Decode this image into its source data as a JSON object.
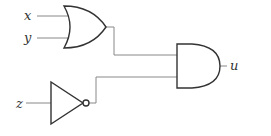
{
  "diagram": {
    "type": "logic-circuit",
    "inputs": [
      {
        "id": "x",
        "label": "x"
      },
      {
        "id": "y",
        "label": "y"
      },
      {
        "id": "z",
        "label": "z"
      }
    ],
    "gates": [
      {
        "id": "or1",
        "kind": "OR",
        "inputs": [
          "x",
          "y"
        ]
      },
      {
        "id": "not1",
        "kind": "NOT",
        "inputs": [
          "z"
        ]
      },
      {
        "id": "and1",
        "kind": "AND",
        "inputs": [
          "or1",
          "not1"
        ]
      }
    ],
    "output": {
      "id": "u",
      "label": "u",
      "source": "and1"
    },
    "colors": {
      "stroke": "#333333",
      "wire": "#888888",
      "background": "#ffffff"
    }
  }
}
